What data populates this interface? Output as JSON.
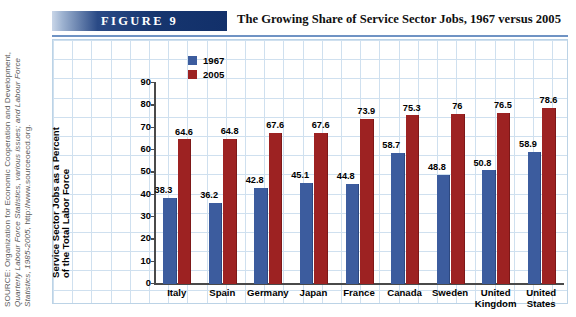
{
  "source_note": {
    "line1": "SOURCE: Organization for Economic Cooperation and Development,",
    "line2": "Quarterly Labour Force Statistics, various issues; and Labour Force",
    "line3_italic": "Statistics, 1985-2005,",
    "line3_plain": " http://www.sourceoecd.org."
  },
  "header": {
    "figure_tag": "FIGURE  9",
    "title": "The Growing Share of Service Sector Jobs, 1967 versus 2005"
  },
  "colors": {
    "series_1967": "#3c5c9e",
    "series_2005": "#9d2222",
    "tag_band": "#16356e",
    "grid": "#cfe0ef",
    "axis": "#4a4a4a"
  },
  "chart_data": {
    "type": "bar",
    "title": "The Growing Share of Service Sector Jobs, 1967 versus 2005",
    "xlabel": "",
    "ylabel": "Service Sector Jobs as a Percent of the Total Labor Force",
    "ylabel_line1": "Service Sector Jobs as a Percent",
    "ylabel_line2": "of the Total Labor Force",
    "ylim": [
      0,
      90
    ],
    "yticks": [
      90,
      80,
      70,
      60,
      50,
      40,
      30,
      20,
      10,
      0
    ],
    "ytick_labels": [
      "90",
      "80",
      "70",
      "60",
      "50",
      "40",
      "30",
      "20",
      "10",
      "0"
    ],
    "grid": true,
    "legend_position": "top-left-inside",
    "categories": [
      "Italy",
      "Spain",
      "Germany",
      "Japan",
      "France",
      "Canada",
      "Sweden",
      "United Kingdom",
      "United States"
    ],
    "category_lines": [
      [
        "Italy"
      ],
      [
        "Spain"
      ],
      [
        "Germany"
      ],
      [
        "Japan"
      ],
      [
        "France"
      ],
      [
        "Canada"
      ],
      [
        "Sweden"
      ],
      [
        "United",
        "Kingdom"
      ],
      [
        "United",
        "States"
      ]
    ],
    "series": [
      {
        "name": "1967",
        "color": "#3c5c9e",
        "values": [
          38.3,
          36.2,
          42.8,
          45.1,
          44.8,
          58.7,
          48.8,
          50.8,
          58.9
        ],
        "labels": [
          "38.3",
          "36.2",
          "42.8",
          "45.1",
          "44.8",
          "58.7",
          "48.8",
          "50.8",
          "58.9"
        ]
      },
      {
        "name": "2005",
        "color": "#9d2222",
        "values": [
          64.6,
          64.8,
          67.6,
          67.6,
          73.9,
          75.3,
          76.0,
          76.5,
          78.6
        ],
        "labels": [
          "64.6",
          "64.8",
          "67.6",
          "67.6",
          "73.9",
          "75.3",
          "76",
          "76.5",
          "78.6"
        ]
      }
    ]
  }
}
